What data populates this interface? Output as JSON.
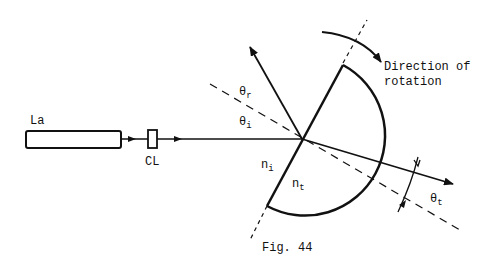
{
  "figure": {
    "caption": "Fig. 44",
    "labels": {
      "laser": "La",
      "lens": "CL",
      "theta_r": "θ",
      "theta_r_sub": "r",
      "theta_i": "θ",
      "theta_i_sub": "i",
      "theta_t": "θ",
      "theta_t_sub": "t",
      "n_i": "n",
      "n_i_sub": "i",
      "n_t": "n",
      "n_t_sub": "t",
      "rotation_line1": "Direction of",
      "rotation_line2": "rotation"
    },
    "colors": {
      "ink": "#111111",
      "background": "#ffffff"
    }
  }
}
